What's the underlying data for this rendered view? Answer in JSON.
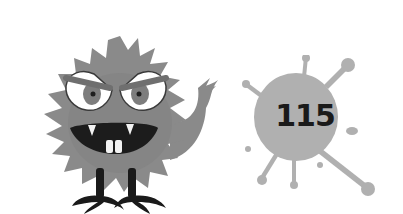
{
  "scene": {
    "background": "#ffffff",
    "monster": {
      "label": "furry gray monster",
      "fur_color": "#8a8a8a",
      "fur_dark": "#6f6f6f",
      "eye_white": "#ffffff",
      "iris_color": "#7d7d7d",
      "pupil_color": "#1e1e1e",
      "mouth_color": "#1c1c1c",
      "teeth_color": "#f2f2f2",
      "leg_color": "#1a1a1a"
    },
    "splat": {
      "label": "paint splat",
      "color": "#b0b0b0",
      "number": "115",
      "number_color": "#1a1a1a"
    }
  }
}
